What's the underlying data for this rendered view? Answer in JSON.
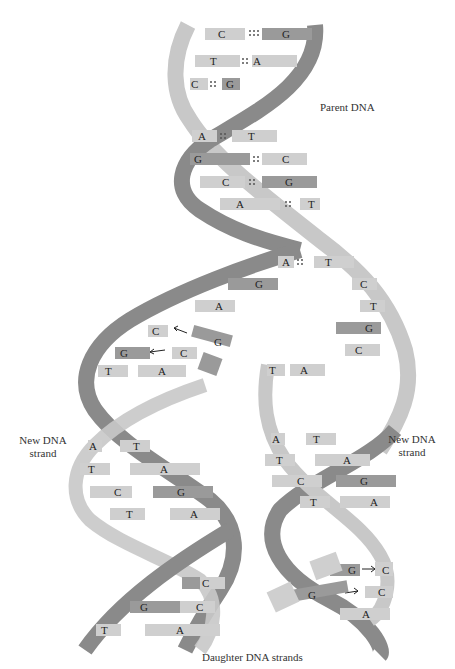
{
  "labels": {
    "parent": "Parent DNA",
    "new_left_1": "New DNA",
    "new_left_2": "strand",
    "new_right_1": "New DNA",
    "new_right_2": "strand",
    "daughter": "Daughter DNA strands"
  },
  "colors": {
    "backbone_dark": "#8a8a8a",
    "backbone_light": "#c8c8c8",
    "base_dark": "#9a9a9a",
    "base_light": "#cfcfcf",
    "text": "#222222"
  },
  "parent_pairs": [
    {
      "left": "C",
      "right": "G",
      "bonds": 3
    },
    {
      "left": "T",
      "right": "A",
      "bonds": 2
    },
    {
      "left": "C",
      "right": "G",
      "bonds": 3
    },
    {
      "left": "A",
      "right": "T",
      "bonds": 2
    },
    {
      "left": "G",
      "right": "C",
      "bonds": 3
    },
    {
      "left": "C",
      "right": "G",
      "bonds": 3
    },
    {
      "left": "A",
      "right": "T",
      "bonds": 2
    },
    {
      "left": "A",
      "right": "T",
      "bonds": 2
    }
  ],
  "fork": {
    "left_unpaired": [
      "G",
      "A"
    ],
    "right_unpaired": [
      "C",
      "T",
      "G",
      "C"
    ],
    "left_incoming": [
      {
        "template": "C",
        "new": "G"
      },
      {
        "template": "G",
        "new": "C"
      }
    ],
    "right_incoming": [
      {
        "template": "C",
        "new": "G"
      },
      {
        "template": "C",
        "new": "G"
      }
    ]
  },
  "left_daughter_pairs": [
    {
      "left": "T",
      "right": "A",
      "bonds": 2
    },
    {
      "left": "A",
      "right": "T",
      "bonds": 2
    },
    {
      "left": "T",
      "right": "A",
      "bonds": 2
    },
    {
      "left": "C",
      "right": "G",
      "bonds": 3
    },
    {
      "left": "T",
      "right": "A",
      "bonds": 2
    },
    {
      "left": "",
      "right": "C",
      "bonds": 3
    },
    {
      "left": "G",
      "right": "C",
      "bonds": 3
    },
    {
      "left": "T",
      "right": "A",
      "bonds": 2
    }
  ],
  "right_daughter_pairs": [
    {
      "left": "T",
      "right": "A",
      "bonds": 2
    },
    {
      "left": "A",
      "right": "T",
      "bonds": 2
    },
    {
      "left": "T",
      "right": "A",
      "bonds": 2
    },
    {
      "left": "C",
      "right": "G",
      "bonds": 3
    },
    {
      "left": "T",
      "right": "A",
      "bonds": 2
    }
  ],
  "right_bottom": [
    "C",
    "C",
    "A"
  ]
}
